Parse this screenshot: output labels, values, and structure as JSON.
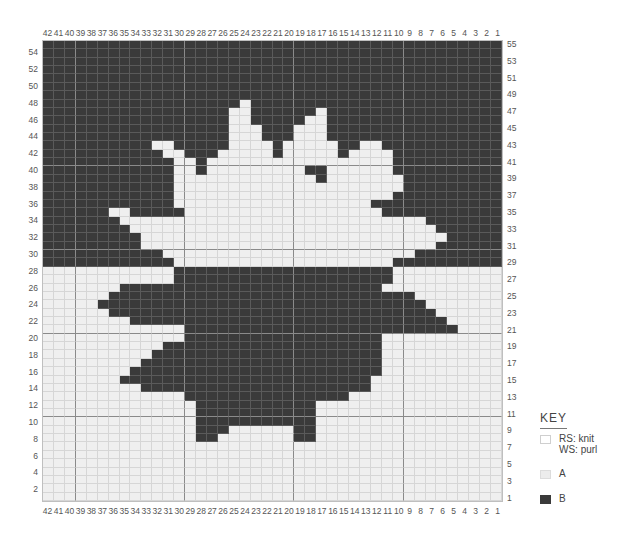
{
  "chart": {
    "columns": 42,
    "rows": 55,
    "column_labels_left_to_right": [
      42,
      41,
      40,
      39,
      38,
      37,
      36,
      35,
      34,
      33,
      32,
      31,
      30,
      29,
      28,
      27,
      26,
      25,
      24,
      23,
      22,
      21,
      20,
      19,
      18,
      17,
      16,
      15,
      14,
      13,
      12,
      11,
      10,
      9,
      8,
      7,
      6,
      5,
      4,
      3,
      2,
      1
    ],
    "row_labels_left": [
      54,
      52,
      50,
      48,
      46,
      44,
      42,
      40,
      38,
      36,
      34,
      32,
      30,
      28,
      26,
      24,
      22,
      20,
      18,
      16,
      14,
      12,
      10,
      8,
      6,
      4,
      2
    ],
    "row_labels_right": [
      55,
      53,
      51,
      49,
      47,
      45,
      43,
      41,
      39,
      37,
      35,
      33,
      31,
      29,
      27,
      25,
      23,
      21,
      19,
      17,
      15,
      13,
      11,
      9,
      7,
      5,
      3,
      1
    ],
    "gridline_columns_after": [
      40,
      30,
      20,
      10
    ],
    "gridline_rows_after": [
      41,
      31,
      21,
      11
    ],
    "colors": {
      "A": "#efefef",
      "B": "#3a3a3a",
      "grid": "#d6d6d6"
    },
    "note_rows": "Each row lists column ranges [from,to] (chart column numbers) that are color B; all other cells are color A.",
    "b_ranges": {
      "55": [
        [
          1,
          42
        ]
      ],
      "54": [
        [
          1,
          42
        ]
      ],
      "53": [
        [
          1,
          42
        ]
      ],
      "52": [
        [
          1,
          42
        ]
      ],
      "51": [
        [
          1,
          42
        ]
      ],
      "50": [
        [
          1,
          42
        ]
      ],
      "49": [
        [
          1,
          42
        ]
      ],
      "48": [
        [
          25,
          42
        ],
        [
          1,
          23
        ]
      ],
      "47": [
        [
          26,
          42
        ],
        [
          18,
          23
        ],
        [
          1,
          16
        ]
      ],
      "46": [
        [
          26,
          42
        ],
        [
          19,
          23
        ],
        [
          1,
          16
        ]
      ],
      "45": [
        [
          26,
          42
        ],
        [
          20,
          22
        ],
        [
          1,
          16
        ]
      ],
      "44": [
        [
          26,
          42
        ],
        [
          20,
          22
        ],
        [
          1,
          16
        ]
      ],
      "43": [
        [
          33,
          42
        ],
        [
          26,
          30
        ],
        [
          21,
          21
        ],
        [
          1,
          11
        ],
        [
          14,
          15
        ]
      ],
      "42": [
        [
          32,
          42
        ],
        [
          27,
          29
        ],
        [
          21,
          21
        ],
        [
          1,
          10
        ],
        [
          15,
          15
        ]
      ],
      "41": [
        [
          31,
          42
        ],
        [
          28,
          28
        ],
        [
          1,
          10
        ]
      ],
      "40": [
        [
          31,
          42
        ],
        [
          28,
          28
        ],
        [
          17,
          18
        ],
        [
          1,
          10
        ]
      ],
      "39": [
        [
          31,
          42
        ],
        [
          17,
          17
        ],
        [
          1,
          9
        ]
      ],
      "38": [
        [
          31,
          42
        ],
        [
          1,
          9
        ]
      ],
      "37": [
        [
          31,
          42
        ],
        [
          1,
          10
        ]
      ],
      "36": [
        [
          31,
          42
        ],
        [
          1,
          12
        ]
      ],
      "35": [
        [
          37,
          42
        ],
        [
          30,
          34
        ],
        [
          1,
          11
        ]
      ],
      "34": [
        [
          36,
          42
        ],
        [
          1,
          7
        ]
      ],
      "33": [
        [
          35,
          42
        ],
        [
          1,
          6
        ]
      ],
      "32": [
        [
          34,
          42
        ],
        [
          1,
          5
        ]
      ],
      "31": [
        [
          34,
          42
        ],
        [
          1,
          6
        ]
      ],
      "30": [
        [
          32,
          42
        ],
        [
          1,
          8
        ]
      ],
      "29": [
        [
          31,
          42
        ],
        [
          1,
          10
        ]
      ],
      "28": [
        [
          11,
          30
        ]
      ],
      "27": [
        [
          11,
          30
        ]
      ],
      "26": [
        [
          12,
          35
        ]
      ],
      "25": [
        [
          9,
          36
        ]
      ],
      "24": [
        [
          8,
          37
        ],
        [
          13,
          13
        ]
      ],
      "23": [
        [
          7,
          36
        ]
      ],
      "22": [
        [
          6,
          34
        ],
        [
          10,
          13
        ]
      ],
      "21": [
        [
          5,
          29
        ],
        [
          12,
          12
        ]
      ],
      "20": [
        [
          12,
          29
        ]
      ],
      "19": [
        [
          12,
          31
        ]
      ],
      "18": [
        [
          12,
          32
        ]
      ],
      "17": [
        [
          12,
          33
        ]
      ],
      "16": [
        [
          12,
          34
        ]
      ],
      "15": [
        [
          13,
          35
        ]
      ],
      "14": [
        [
          13,
          33
        ]
      ],
      "13": [
        [
          15,
          29
        ]
      ],
      "12": [
        [
          18,
          28
        ],
        [
          20,
          20
        ]
      ],
      "11": [
        [
          18,
          28
        ]
      ],
      "10": [
        [
          18,
          28
        ],
        [
          21,
          26
        ]
      ],
      "9": [
        [
          18,
          19
        ],
        [
          26,
          28
        ]
      ],
      "8": [
        [
          18,
          19
        ],
        [
          27,
          28
        ]
      ],
      "7": [],
      "6": [],
      "5": [],
      "4": [],
      "3": [],
      "2": [],
      "1": []
    }
  },
  "key": {
    "title": "KEY",
    "items": [
      {
        "swatch": "rs",
        "label": "RS: knit\nWS: purl"
      },
      {
        "swatch": "a",
        "label": "A"
      },
      {
        "swatch": "b",
        "label": "B"
      }
    ]
  }
}
